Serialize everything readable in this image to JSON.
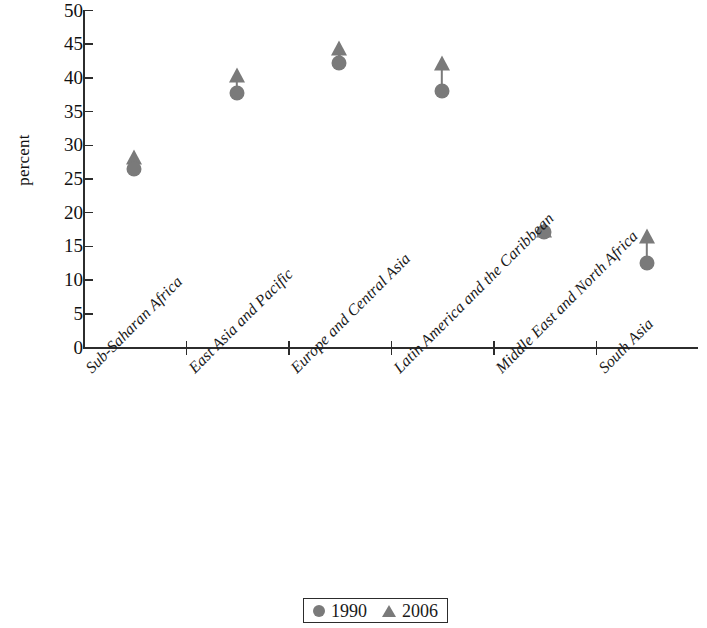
{
  "chart_data": {
    "type": "scatter",
    "title": "",
    "subtitle": "",
    "xlabel": "",
    "ylabel": "percent",
    "ylim": [
      0,
      50
    ],
    "ytick_step": 5,
    "yticks": [
      "50",
      "45",
      "40",
      "35",
      "30",
      "25",
      "20",
      "15",
      "10",
      "5",
      "0"
    ],
    "grid": false,
    "legend_position": "bottom-center",
    "marker_color": "#7a7a7a",
    "axis_color": "#2c2c2c",
    "categories": [
      "Sub-Saharan Africa",
      "East Asia and Pacific",
      "Europe and Central Asia",
      "Latin America and the Caribbean",
      "Middle East and North Africa",
      "South Asia"
    ],
    "series": [
      {
        "name": "1990",
        "marker": "circle",
        "values": [
          26.5,
          37.8,
          42.2,
          38.0,
          17.2,
          12.5
        ]
      },
      {
        "name": "2006",
        "marker": "triangle",
        "values": [
          28.3,
          40.5,
          44.5,
          42.2,
          17.5,
          16.5
        ]
      }
    ]
  },
  "legend": {
    "entries": [
      {
        "label": "1990",
        "marker": "circle"
      },
      {
        "label": "2006",
        "marker": "triangle"
      }
    ]
  }
}
